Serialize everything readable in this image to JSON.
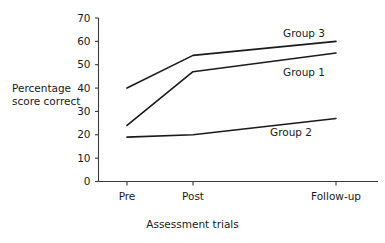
{
  "chart_data": {
    "type": "line",
    "title": "",
    "subtitle": "",
    "xlabel": "Assessment trials",
    "ylabel": "Percentage score correct",
    "ylabel_line1": "Percentage",
    "ylabel_line2": "score correct",
    "categories": [
      "Pre",
      "Post",
      "Follow-up"
    ],
    "ylim": [
      0,
      70
    ],
    "yticks": [
      0,
      10,
      20,
      30,
      40,
      50,
      60,
      70
    ],
    "ytick_labels": [
      "0",
      "10",
      "20",
      "30",
      "40",
      "50",
      "60",
      "70"
    ],
    "grid": false,
    "legend_position": "inline-right",
    "line_color": "#1a1a1a",
    "series": [
      {
        "name": "Group 3",
        "values": [
          40,
          54,
          60
        ],
        "label": "Group 3"
      },
      {
        "name": "Group 1",
        "values": [
          24,
          47,
          55
        ],
        "label": "Group 1"
      },
      {
        "name": "Group 2",
        "values": [
          19,
          20,
          27
        ],
        "label": "Group 2"
      }
    ],
    "annotations": [
      {
        "text": "Group 3",
        "series": "Group 3"
      },
      {
        "text": "Group 1",
        "series": "Group 1"
      },
      {
        "text": "Group 2",
        "series": "Group 2"
      }
    ]
  },
  "axes": {
    "y_axis_name": "percentage-score-correct-axis",
    "x_axis_name": "assessment-trials-axis"
  }
}
